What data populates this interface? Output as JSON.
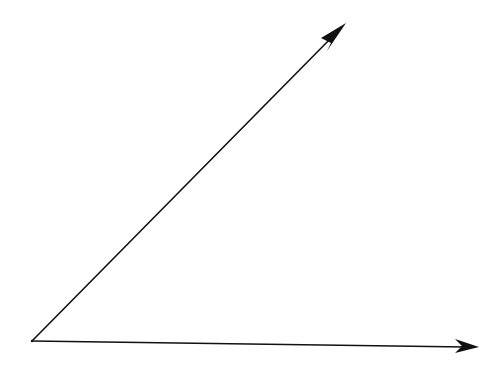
{
  "diagram": {
    "type": "angle",
    "colors": {
      "background": "#ffffff",
      "stroke": "#111111"
    },
    "rays": [
      {
        "name": "upper-ray",
        "direction": "up-right",
        "arrowhead": true
      },
      {
        "name": "lower-ray",
        "direction": "right",
        "arrowhead": true
      }
    ],
    "labels": []
  }
}
